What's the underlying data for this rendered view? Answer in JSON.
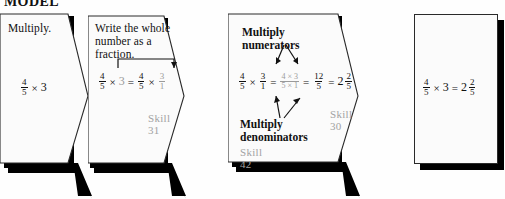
{
  "header": {
    "title": "MODEL"
  },
  "diagram": {
    "type": "flowchart",
    "topic": "Multiplying a fraction by a whole number",
    "problem": "4/5 × 3",
    "answer": "2 2/5",
    "panels": [
      {
        "id": "panel-1",
        "title": "Multiply.",
        "shape": "chevron",
        "equation": {
          "text": "4/5 × 3",
          "parts": [
            {
              "kind": "fraction",
              "num": "4",
              "den": "5",
              "color": "black"
            },
            {
              "kind": "op",
              "text": "×"
            },
            {
              "kind": "whole",
              "text": "3",
              "color": "black"
            }
          ]
        },
        "skill": ""
      },
      {
        "id": "panel-2",
        "title": "Write the whole number as a fraction.",
        "shape": "chevron",
        "equation": {
          "text": "4/5 × 3 = 4/5 × 3/1",
          "parts": [
            {
              "kind": "fraction",
              "num": "4",
              "den": "5",
              "color": "black"
            },
            {
              "kind": "op",
              "text": "×"
            },
            {
              "kind": "whole",
              "text": "3",
              "color": "gray"
            },
            {
              "kind": "op",
              "text": "="
            },
            {
              "kind": "fraction",
              "num": "4",
              "den": "5",
              "color": "black"
            },
            {
              "kind": "op",
              "text": "×"
            },
            {
              "kind": "fraction",
              "num": "3",
              "den": "1",
              "color": "gray"
            }
          ]
        },
        "annotation": "bracket-arrow from 3 to 3/1",
        "skill": "Skill 31"
      },
      {
        "id": "panel-3",
        "title": "",
        "shape": "chevron",
        "label_top": "Multiply numerators",
        "label_bottom": "Multiply denominators",
        "equation": {
          "text": "4/5 × 3/1 = (4×3)/(5×1) = 12/5 = 2 2/5",
          "parts": [
            {
              "kind": "fraction",
              "num": "4",
              "den": "5",
              "color": "black"
            },
            {
              "kind": "op",
              "text": "×"
            },
            {
              "kind": "fraction",
              "num": "3",
              "den": "1",
              "color": "black"
            },
            {
              "kind": "op",
              "text": "="
            },
            {
              "kind": "fraction",
              "num": "4 × 3",
              "den": "5 × 1",
              "color": "gray"
            },
            {
              "kind": "op",
              "text": "="
            },
            {
              "kind": "fraction",
              "num": "12",
              "den": "5",
              "color": "black"
            },
            {
              "kind": "op",
              "text": "="
            },
            {
              "kind": "mixed",
              "int": "2",
              "num": "2",
              "den": "5",
              "color": "black"
            }
          ]
        },
        "skill": "Skill 30",
        "skill2": "Skill 42"
      },
      {
        "id": "panel-4",
        "title": "",
        "shape": "rectangle",
        "equation": {
          "text": "4/5 × 3 = 2 2/5",
          "parts": [
            {
              "kind": "fraction",
              "num": "4",
              "den": "5",
              "color": "black"
            },
            {
              "kind": "op",
              "text": "×"
            },
            {
              "kind": "whole",
              "text": "3",
              "color": "black"
            },
            {
              "kind": "op",
              "text": "="
            },
            {
              "kind": "mixed",
              "int": "2",
              "num": "2",
              "den": "5",
              "color": "black"
            }
          ]
        },
        "skill": ""
      }
    ]
  },
  "text": {
    "p1_title": "Multiply.",
    "p2_title_l1": "Write the whole",
    "p2_title_l2": "number as a fraction.",
    "p2_skill": "Skill 31",
    "p3_label_top": "Multiply numerators",
    "p3_label_bot_l1": "Multiply",
    "p3_label_bot_l2": "denominators",
    "p3_skill": "Skill 30",
    "p3_skill2": "Skill 42",
    "n4": "4",
    "n5": "5",
    "n3": "3",
    "n1": "1",
    "n12": "12",
    "n2": "2",
    "num43": "4 × 3",
    "den51": "5 × 1",
    "times": "×",
    "equals": "="
  },
  "colors": {
    "ink": "#111111",
    "gray_skill": "#a2a2a2",
    "gray_num": "#9a9a9a",
    "panel_fill": "#fbfbfb",
    "panel_border": "#2a2a2a",
    "shadow": "#000000",
    "page": "#fefefe"
  }
}
